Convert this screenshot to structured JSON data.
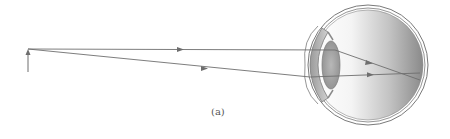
{
  "figure": {
    "label": "(a)"
  },
  "colors": {
    "ray": "#6e6e6e",
    "outline": "#7a7a7a",
    "eyeball_dark": "#8c8c8c",
    "eyeball_light": "#ffffff",
    "lens": "#a8a8a8",
    "label": "#555555"
  },
  "elements": {
    "object_arrow": {
      "name": "object",
      "x": 28,
      "y_base": 71,
      "y_tip": 49
    },
    "rays": [
      {
        "name": "upper-ray",
        "points": [
          [
            28,
            49
          ],
          [
            335,
            50
          ],
          [
            420,
            80
          ]
        ],
        "arrow_at": [
          181,
          49
        ]
      },
      {
        "name": "lower-ray",
        "points": [
          [
            28,
            49
          ],
          [
            310,
            76
          ],
          [
            420,
            73
          ]
        ],
        "arrow_at": [
          205,
          68
        ]
      }
    ],
    "eye": {
      "center": [
        367,
        65
      ],
      "radius": 58
    }
  }
}
